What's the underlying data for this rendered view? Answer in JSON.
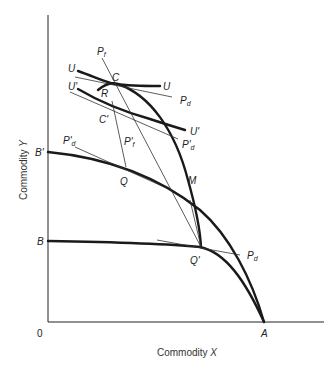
{
  "diagram": {
    "type": "economics-trade-diagram",
    "axes": {
      "x_label": "Commodity",
      "x_var": "X",
      "y_label": "Commodity",
      "y_var": "Y",
      "origin": "0"
    },
    "points": {
      "A": "A",
      "B": "B",
      "B_prime": "B'",
      "C": "C",
      "C_prime": "C'",
      "Q": "Q",
      "Q_prime": "Q'",
      "M": "M",
      "R": "R"
    },
    "curves": {
      "U": "U",
      "U_prime": "U'"
    },
    "price_lines": {
      "Pd": "P",
      "Pd_sub": "d",
      "Pf": "P",
      "Pf_sub": "f",
      "Pd_prime": "P'",
      "Pf_prime": "P'"
    }
  }
}
